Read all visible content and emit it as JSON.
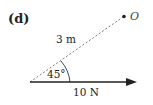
{
  "figure": {
    "part_label": "(d)",
    "point": {
      "label": "O"
    },
    "distance": {
      "label": "3 m",
      "style": "dashed"
    },
    "angle": {
      "label": "45°"
    },
    "force": {
      "label": "10 N",
      "direction": "right"
    },
    "colors": {
      "line": "#222222",
      "dashed": "#777777",
      "text": "#222222"
    }
  }
}
